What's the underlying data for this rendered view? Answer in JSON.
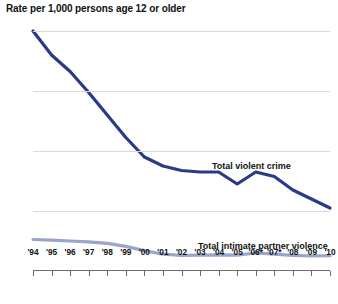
{
  "chart_data": {
    "type": "line",
    "title": "Rate per 1,000 persons age 12 or older",
    "xlabel": "",
    "ylabel": "",
    "ylim": [
      0,
      80
    ],
    "yticks": [
      0,
      20,
      40,
      60,
      80
    ],
    "grid": true,
    "legend_position": "inline-labels",
    "categories": [
      "'94",
      "'95",
      "'96",
      "'97",
      "'98",
      "'99",
      "'00",
      "'01",
      "'02",
      "'03",
      "'04",
      "'05",
      "'06*",
      "'07*",
      "'08",
      "'09",
      "'10"
    ],
    "series": [
      {
        "name": "Total violent crime",
        "color": "#2a3a88",
        "values": [
          80.0,
          72.0,
          66.5,
          59.5,
          52.0,
          44.5,
          38.0,
          35.0,
          33.5,
          33.0,
          33.0,
          29.0,
          33.0,
          31.5,
          27.0,
          24.0,
          21.0
        ]
      },
      {
        "name": "Total intimate partner violence",
        "color": "#9aa5cd",
        "values": [
          10.5,
          10.3,
          10.0,
          9.7,
          9.2,
          8.2,
          6.8,
          5.6,
          5.2,
          5.3,
          5.4,
          5.3,
          6.0,
          5.6,
          5.2,
          5.0,
          5.1
        ]
      }
    ],
    "labels": {
      "violent": "Total violent crime",
      "ipv": "Total intimate partner violence"
    }
  }
}
